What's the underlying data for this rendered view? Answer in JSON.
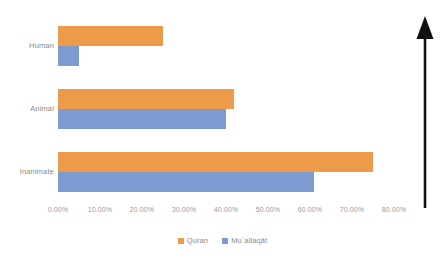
{
  "chart_data": {
    "type": "bar",
    "orientation": "horizontal",
    "title": "",
    "subtitle": "",
    "xlabel": "",
    "ylabel": "",
    "categories": [
      "Human",
      "Animal",
      "Inanimate"
    ],
    "series": [
      {
        "name": "Quran",
        "color": "#ED9A4A",
        "values": [
          25.0,
          42.0,
          75.0
        ]
      },
      {
        "name": "Muʿallaqāt",
        "color": "#7B9BD1",
        "values": [
          5.0,
          40.0,
          61.0
        ]
      }
    ],
    "xlim": [
      0,
      80
    ],
    "xticks": [
      0,
      10,
      20,
      30,
      40,
      50,
      60,
      70,
      80
    ],
    "xtick_labels": [
      "0.00%",
      "10.00%",
      "20.00%",
      "30.00%",
      "40.00%",
      "50.00%",
      "60.00%",
      "70.00%",
      "80.00%"
    ],
    "grid": false,
    "legend_position": "bottom-center",
    "background_color": "#FFFFFF",
    "axis_text_color": "#8A8A8A"
  },
  "annotation": {
    "arrow": {
      "name": "upward-arrow",
      "direction": "up",
      "color": "#000000"
    }
  },
  "legend": {
    "items": [
      {
        "label": "Quran",
        "color": "#ED9A4A"
      },
      {
        "label": "Muʿallaqāt",
        "color": "#7B9BD1"
      }
    ]
  }
}
